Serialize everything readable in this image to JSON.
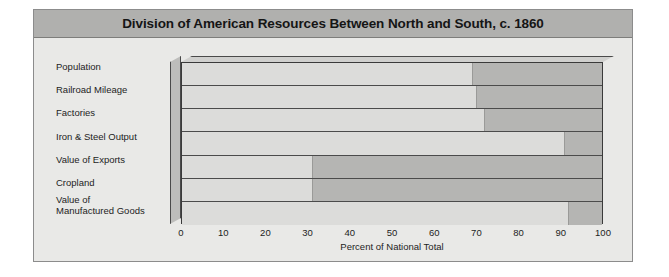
{
  "chart": {
    "title": "Division of American Resources Between North and South, c. 1860",
    "x_axis_title": "Percent of National Total"
  },
  "chart_data": {
    "type": "bar",
    "orientation": "horizontal",
    "stacked": "100-percent",
    "title": "Division of American Resources Between North and South, c. 1860",
    "xlabel": "Percent of National Total",
    "ylabel": "",
    "xlim": [
      0,
      100
    ],
    "xticks": [
      0,
      10,
      20,
      30,
      40,
      50,
      60,
      70,
      80,
      90,
      100
    ],
    "grid": true,
    "legend": "none",
    "categories": [
      "Population",
      "Railroad Mileage",
      "Factories",
      "Iron & Steel Output",
      "Value of Exports",
      "Cropland",
      "Value of\n   Manufactured Goods"
    ],
    "series": [
      {
        "name": "North",
        "color": "#dcdcda",
        "values": [
          69,
          70,
          72,
          91,
          31,
          31,
          92
        ]
      },
      {
        "name": "South",
        "color": "#b5b5b3",
        "values": [
          31,
          30,
          28,
          9,
          69,
          69,
          8
        ]
      }
    ]
  },
  "colors": {
    "figure_background": "#e9e9e7",
    "title_bar": "#b0b0ae",
    "plot_background": "#dedede",
    "north_segment": "#dcdcda",
    "south_segment": "#b5b5b3",
    "gridline": "#4b4b4b",
    "text": "#1d1d1d"
  }
}
